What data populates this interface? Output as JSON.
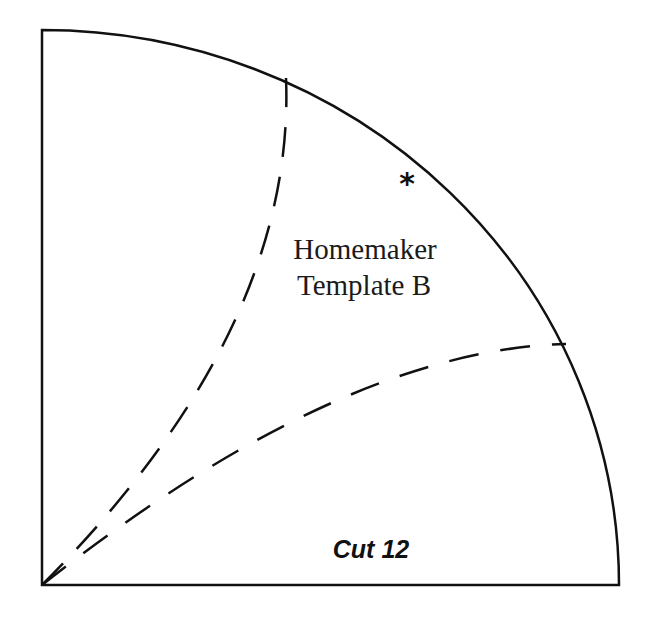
{
  "template": {
    "title_line_1": "Homemaker",
    "title_line_2": "Template B",
    "instruction": "Cut 12",
    "marker": "*"
  },
  "colors": {
    "outline": "#111111",
    "background": "#ffffff"
  }
}
